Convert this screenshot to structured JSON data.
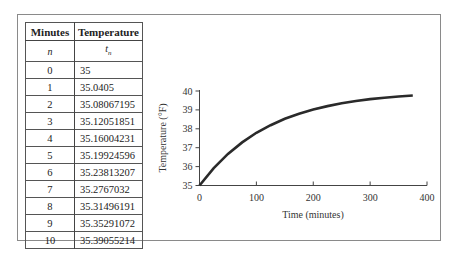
{
  "table": {
    "headers": [
      "Minutes",
      "Temperature"
    ],
    "subheaders": [
      "n",
      "t_n"
    ],
    "rows": [
      [
        "0",
        "35"
      ],
      [
        "1",
        "35.0405"
      ],
      [
        "2",
        "35.08067195"
      ],
      [
        "3",
        "35.12051851"
      ],
      [
        "4",
        "35.16004231"
      ],
      [
        "5",
        "35.19924596"
      ],
      [
        "6",
        "35.23813207"
      ],
      [
        "7",
        "35.2767032"
      ],
      [
        "8",
        "35.31496191"
      ],
      [
        "9",
        "35.35291072"
      ],
      [
        "10",
        "35.39055214"
      ]
    ]
  },
  "chart_data": {
    "type": "line",
    "title": "",
    "xlabel": "Time (minutes)",
    "ylabel": "Temperature (°F)",
    "xlim": [
      0,
      400
    ],
    "ylim": [
      35,
      40
    ],
    "xticks": [
      0,
      100,
      200,
      300,
      400
    ],
    "yticks": [
      35,
      36,
      37,
      38,
      39,
      40
    ],
    "grid": false,
    "legend": null,
    "series": [
      {
        "name": "Temperature",
        "x": [
          0,
          25,
          50,
          75,
          100,
          125,
          150,
          175,
          200,
          225,
          250,
          275,
          300,
          325,
          350,
          375
        ],
        "y": [
          35,
          35.92,
          36.67,
          37.28,
          37.79,
          38.19,
          38.53,
          38.8,
          39.02,
          39.2,
          39.35,
          39.47,
          39.57,
          39.64,
          39.71,
          39.76
        ]
      }
    ],
    "model": "T(t) = 40 - 5*e^(-0.00814 t)"
  }
}
